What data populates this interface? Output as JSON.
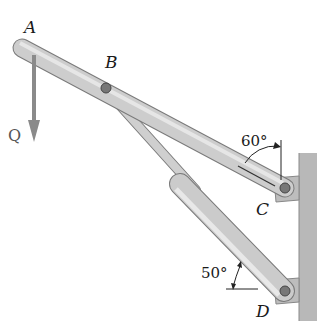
{
  "diagram": {
    "points": {
      "A": {
        "label": "A",
        "x": 22,
        "y": 48
      },
      "B": {
        "label": "B",
        "x": 106,
        "y": 88
      },
      "C": {
        "label": "C",
        "x": 285,
        "y": 188
      },
      "D": {
        "label": "D",
        "x": 285,
        "y": 291
      }
    },
    "load": {
      "label": "Q",
      "direction": "down"
    },
    "angles": {
      "lever_angle": "60°",
      "cylinder_angle": "50°"
    },
    "colors": {
      "member_fill": "#c9c9c9",
      "member_stroke": "#7a7a7a",
      "arrow": "#8a8a8a",
      "wall": "#b5b5b5",
      "text": "#1a1a1a"
    }
  }
}
